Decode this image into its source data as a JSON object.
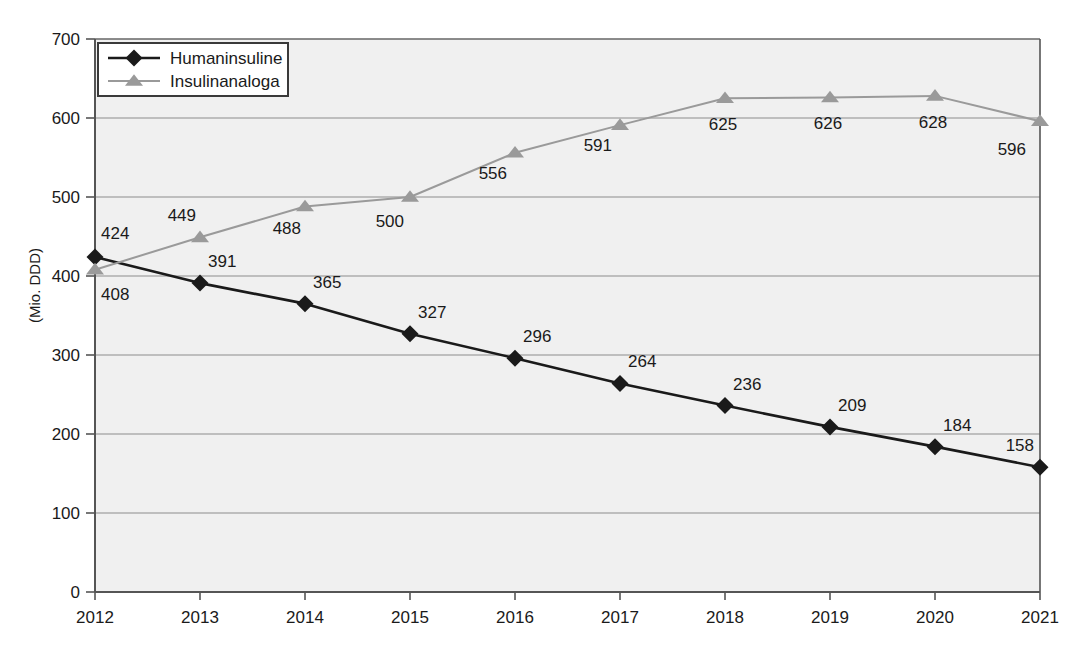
{
  "chart_data": {
    "type": "line",
    "title": "",
    "xlabel": "",
    "ylabel": "(Mio. DDD)",
    "categories": [
      "2012",
      "2013",
      "2014",
      "2015",
      "2016",
      "2017",
      "2018",
      "2019",
      "2020",
      "2021"
    ],
    "ylim": [
      0,
      700
    ],
    "yticks": [
      0,
      100,
      200,
      300,
      400,
      500,
      600,
      700
    ],
    "grid": true,
    "legend_position": "top-left",
    "series": [
      {
        "name": "Humaninsuline",
        "color": "#1a1a1a",
        "marker": "diamond",
        "values": [
          424,
          391,
          365,
          327,
          296,
          264,
          236,
          209,
          184,
          158
        ],
        "labels": [
          "424",
          "391",
          "365",
          "327",
          "296",
          "264",
          "236",
          "209",
          "184",
          "158"
        ]
      },
      {
        "name": "Insulinanaloga",
        "color": "#9a9a9a",
        "marker": "triangle",
        "values": [
          408,
          449,
          488,
          500,
          556,
          591,
          625,
          626,
          628,
          596
        ],
        "labels": [
          "408",
          "449",
          "488",
          "500",
          "556",
          "591",
          "625",
          "626",
          "628",
          "596"
        ]
      }
    ]
  },
  "axes": {
    "y_tick_labels": [
      "0",
      "100",
      "200",
      "300",
      "400",
      "500",
      "600",
      "700"
    ],
    "x_tick_labels": [
      "2012",
      "2013",
      "2014",
      "2015",
      "2016",
      "2017",
      "2018",
      "2019",
      "2020",
      "2021"
    ],
    "y_axis_title": "(Mio. DDD)"
  },
  "legend": {
    "items": [
      {
        "label": "Humaninsuline",
        "marker": "diamond-marker",
        "color": "#1a1a1a"
      },
      {
        "label": "Insulinanaloga",
        "marker": "triangle-marker",
        "color": "#9a9a9a"
      }
    ]
  },
  "colors": {
    "series_1": "#1a1a1a",
    "series_2": "#9a9a9a",
    "plot_background": "#f0f0f0",
    "gridline": "#8c8c8c",
    "axis": "#555555",
    "page_background": "#ffffff"
  }
}
